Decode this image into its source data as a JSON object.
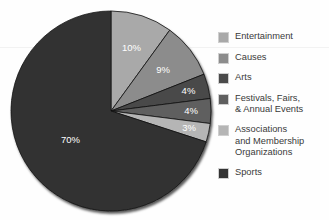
{
  "chart_data": {
    "type": "pie",
    "title": "",
    "subtitle": "",
    "xlabel": "",
    "ylabel": "",
    "legend_position": "right",
    "grid": false,
    "start_angle_deg": 0,
    "direction": "clockwise",
    "categories": [
      "Entertainment",
      "Causes",
      "Arts",
      "Festivals, Fairs,\n& Annual Events",
      "Associations\nand Membership\nOrganizations",
      "Sports"
    ],
    "values": [
      10,
      9,
      4,
      4,
      3,
      70
    ],
    "value_labels": [
      "10%",
      "9%",
      "4%",
      "4%",
      "3%",
      "70%"
    ],
    "colors": [
      "#a9a9a9",
      "#8c8c8c",
      "#4a4a4a",
      "#5f5f5f",
      "#b5b5b5",
      "#333333"
    ],
    "slices": [
      {
        "label": "Entertainment",
        "value": 10,
        "display": "10%",
        "color": "#a9a9a9"
      },
      {
        "label": "Causes",
        "value": 9,
        "display": "9%",
        "color": "#8c8c8c"
      },
      {
        "label": "Arts",
        "value": 4,
        "display": "4%",
        "color": "#4a4a4a"
      },
      {
        "label": "Festivals, Fairs, & Annual Events",
        "value": 4,
        "display": "4%",
        "color": "#5f5f5f"
      },
      {
        "label": "Associations and Membership Organizations",
        "value": 3,
        "display": "3%",
        "color": "#b5b5b5"
      },
      {
        "label": "Sports",
        "value": 70,
        "display": "70%",
        "color": "#333333"
      }
    ]
  },
  "legend": {
    "items": [
      {
        "label": "Entertainment",
        "color": "#a9a9a9"
      },
      {
        "label": "Causes",
        "color": "#8c8c8c"
      },
      {
        "label": "Arts",
        "color": "#4a4a4a"
      },
      {
        "label": "Festivals, Fairs,\n& Annual Events",
        "color": "#5f5f5f"
      },
      {
        "label": "Associations\nand Membership\nOrganizations",
        "color": "#b5b5b5"
      },
      {
        "label": "Sports",
        "color": "#333333"
      }
    ]
  },
  "style": {
    "background": "#fefefe",
    "label_text_color": "#ffffff",
    "legend_text_color": "#3a3a3a",
    "pie_outline_color": "#111111"
  }
}
